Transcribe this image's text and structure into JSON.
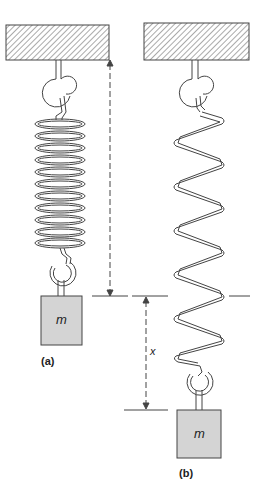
{
  "diagram": {
    "type": "spring-mass",
    "panels": [
      {
        "id": "a",
        "label": "(a)",
        "mass_label": "m",
        "state": "unstretched spring with mass attached"
      },
      {
        "id": "b",
        "label": "(b)",
        "mass_label": "m",
        "state": "stretched spring, displaced by x"
      }
    ],
    "dimension": {
      "label": "x",
      "meaning": "extension of spring"
    },
    "colors": {
      "stroke": "#444444",
      "mass_fill": "#d4d4d4",
      "ceiling_hatch": "#555555",
      "background": "#ffffff"
    }
  }
}
